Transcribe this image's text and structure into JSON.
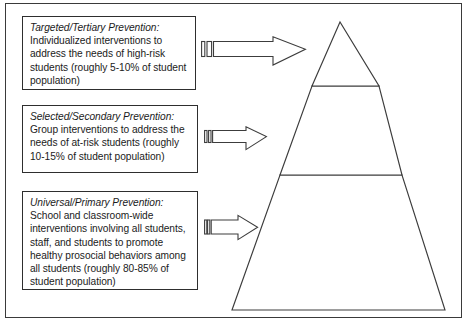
{
  "diagram": {
    "frame": {
      "name": "outer-border"
    },
    "tiers": [
      {
        "id": "tier-targeted",
        "heading": "Targeted/Tertiary Prevention",
        "heading_suffix": ":",
        "body": " Individualized interventions to address the needs of high-risk students (roughly 5-10% of student population)",
        "percent_label": "5-10%",
        "arrow": {
          "name": "arrow-right-striped-tail",
          "points_to": "pyramid-top-tier"
        }
      },
      {
        "id": "tier-selected",
        "heading": "Selected/Secondary Prevention",
        "heading_suffix": ":",
        "body": " Group interventions to address the needs of at-risk students (roughly 10-15% of student population)",
        "percent_label": "10-15%",
        "arrow": {
          "name": "arrow-right-striped-tail",
          "points_to": "pyramid-middle-tier"
        }
      },
      {
        "id": "tier-universal",
        "heading": "Universal/Primary Prevention",
        "heading_suffix": ":",
        "body": " School and classroom-wide interventions involving all students, staff, and students to promote healthy prosocial behaviors among all students (roughly 80-85% of student population)",
        "percent_label": "80-85%",
        "arrow": {
          "name": "arrow-right-striped-tail",
          "points_to": "pyramid-bottom-tier"
        }
      }
    ],
    "pyramid": {
      "name": "three-tier-pyramid",
      "segments": [
        "top",
        "middle",
        "bottom"
      ],
      "fill": "#ffffff",
      "stroke": "#3c3c3c"
    },
    "colors": {
      "line": "#3c3c3c",
      "text": "#1b1b1b",
      "background": "#ffffff"
    }
  }
}
